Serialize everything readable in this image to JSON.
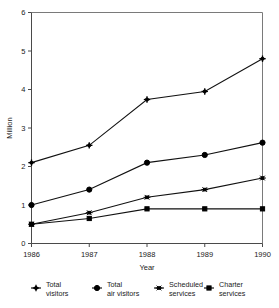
{
  "chart_data": {
    "type": "line",
    "title": "",
    "xlabel": "Year",
    "ylabel": "Million",
    "categories": [
      "1986",
      "1987",
      "1988",
      "1989",
      "1990"
    ],
    "x": [
      1986,
      1987,
      1988,
      1989,
      1990
    ],
    "xlim": [
      1986,
      1990
    ],
    "ylim": [
      0,
      6
    ],
    "yticks": [
      "0",
      "1",
      "2",
      "3",
      "4",
      "5",
      "6"
    ],
    "ytick_values": [
      0,
      1,
      2,
      3,
      4,
      5,
      6
    ],
    "xticks": [
      "1986",
      "1987",
      "1988",
      "1989",
      "1990"
    ],
    "grid": false,
    "legend_position": "bottom",
    "series": [
      {
        "name": "Total visitors",
        "label_line1": "Total",
        "label_line2": "visitors",
        "marker": "cross-plus",
        "color": "#000000",
        "values": [
          2.1,
          2.55,
          3.74,
          3.95,
          4.8
        ]
      },
      {
        "name": "Total air visitors",
        "label_line1": "Total",
        "label_line2": "air visitors",
        "marker": "filled-circle",
        "color": "#000000",
        "values": [
          1.0,
          1.4,
          2.1,
          2.3,
          2.62
        ]
      },
      {
        "name": "Scheduled services",
        "label_line1": "Scheduled",
        "label_line2": "services",
        "marker": "asterisk",
        "color": "#000000",
        "values": [
          0.5,
          0.8,
          1.2,
          1.4,
          1.7
        ]
      },
      {
        "name": "Charter services",
        "label_line1": "Charter",
        "label_line2": "services",
        "marker": "small-square",
        "color": "#000000",
        "values": [
          0.5,
          0.65,
          0.9,
          0.9,
          0.9
        ]
      }
    ]
  },
  "axes": {
    "y_label": "Million",
    "x_label": "Year"
  },
  "colors": {
    "ink": "#000000",
    "axis": "#4a4a4a",
    "frame": "#7a7a7a",
    "background": "#ffffff"
  }
}
